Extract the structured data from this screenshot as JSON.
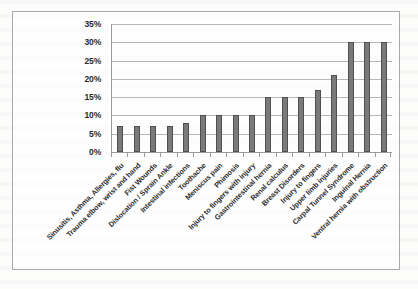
{
  "chart_data": {
    "type": "bar",
    "title": "",
    "subtitle": "",
    "xlabel": "",
    "ylabel": "",
    "ylim": [
      0,
      35
    ],
    "y_tick_labels": [
      "35%",
      "30%",
      "25%",
      "20%",
      "15%",
      "10%",
      "5%",
      "0%"
    ],
    "y_tick_values": [
      35,
      30,
      25,
      20,
      15,
      10,
      5,
      0
    ],
    "grid": true,
    "legend": false,
    "legend_position": "none",
    "value_suffix": "%",
    "categories": [
      "Sinusitis, Asthma, Allergies, flu",
      "Trauma elbow, wrist and hand",
      "Fist Wounds",
      "Dislocation / Sprain Ankle",
      "Intestinal infections",
      "Toothache",
      "Meniscus pain",
      "Phimosis",
      "Injury to fingers with injury",
      "Gastrointestinal hernia",
      "Renal calculus",
      "Breast Disorders",
      "Injury to fingers",
      "Upper limb injuries",
      "Carpal Tunnel Syndrome",
      "Inguinal Hernia",
      "Ventral hernia with obstruction"
    ],
    "values": [
      7,
      7,
      7,
      7,
      8,
      10,
      10,
      10,
      10,
      15,
      15,
      15,
      17,
      21,
      30,
      30,
      30
    ],
    "bar_color": "#7a7a7a",
    "bar_border_color": "#4f4f4f",
    "gridline_color": "#b7b7b7",
    "axis_color": "#9a9a9a",
    "frame_border_color": "#a9a9a9",
    "text_color": "#2d2d2d"
  }
}
